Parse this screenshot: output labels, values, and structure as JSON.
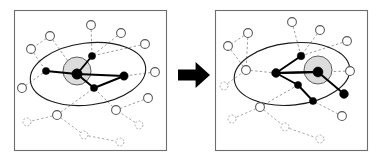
{
  "figure": {
    "panel_count": 2,
    "transition_symbol": "➡",
    "colors": {
      "background": "#ffffff",
      "panel_border": "#6e6e6e",
      "panel_fill": "#ffffff",
      "outer_ellipse_stroke": "#1a1a1a",
      "inner_circle_stroke": "#4d4d4d",
      "inner_circle_fill": "#dcdcdc",
      "core_node_fill": "#000000",
      "peripheral_node_fill": "#ffffff",
      "peripheral_node_stroke": "#555555",
      "faint_node_stroke": "#9a9a9a",
      "core_edge": "#000000",
      "peripheral_edge": "#8a8a8a",
      "dashed_edge": "#6f6f6f",
      "arrow_fill": "#000000"
    },
    "panels": [
      {
        "id": "before",
        "label": "left-panel",
        "frame": {
          "x": 14,
          "y": 10,
          "w": 152,
          "h": 140
        },
        "outer_ellipse": {
          "cx": 88,
          "cy": 74,
          "rx": 58,
          "ry": 31,
          "rotation": -7
        },
        "inner_circle": {
          "cx": 77,
          "cy": 71,
          "r": 14
        },
        "core_nodes": [
          {
            "name": "hub",
            "x": 77,
            "y": 74,
            "r": 5.2
          },
          {
            "name": "core-upper",
            "x": 92,
            "y": 56,
            "r": 3.6
          },
          {
            "name": "core-left",
            "x": 46,
            "y": 71,
            "r": 3.6
          },
          {
            "name": "core-right",
            "x": 124,
            "y": 76,
            "r": 4.2
          },
          {
            "name": "core-lower",
            "x": 94,
            "y": 88,
            "r": 3.6
          }
        ],
        "core_edges": [
          [
            "hub",
            "core-upper"
          ],
          [
            "hub",
            "core-left"
          ],
          [
            "hub",
            "core-right"
          ],
          [
            "hub",
            "core-lower"
          ],
          [
            "core-lower",
            "core-right"
          ]
        ],
        "peripheral_nodes": [
          {
            "name": "p1",
            "x": 91,
            "y": 25,
            "r": 4.4,
            "faint": false
          },
          {
            "name": "p2",
            "x": 121,
            "y": 33,
            "r": 4.4,
            "faint": false
          },
          {
            "name": "p3",
            "x": 145,
            "y": 44,
            "r": 4.4,
            "faint": false
          },
          {
            "name": "p4",
            "x": 50,
            "y": 36,
            "r": 4.4,
            "faint": false
          },
          {
            "name": "p5",
            "x": 31,
            "y": 49,
            "r": 4.4,
            "faint": false
          },
          {
            "name": "p6",
            "x": 155,
            "y": 72,
            "r": 4.4,
            "faint": false
          },
          {
            "name": "p7",
            "x": 22,
            "y": 88,
            "r": 4.4,
            "faint": false
          },
          {
            "name": "p8",
            "x": 148,
            "y": 98,
            "r": 4.4,
            "faint": false
          },
          {
            "name": "p9",
            "x": 116,
            "y": 110,
            "r": 4.4,
            "faint": false
          },
          {
            "name": "p10",
            "x": 57,
            "y": 115,
            "r": 4.4,
            "faint": false
          },
          {
            "name": "p11",
            "x": 27,
            "y": 122,
            "r": 4.0,
            "faint": true
          },
          {
            "name": "p12",
            "x": 139,
            "y": 125,
            "r": 4.0,
            "faint": true
          },
          {
            "name": "p13",
            "x": 84,
            "y": 135,
            "r": 4.0,
            "faint": true
          },
          {
            "name": "p14",
            "x": 120,
            "y": 142,
            "r": 4.0,
            "faint": true
          }
        ],
        "dashed_edges": [
          [
            "p1",
            "core-upper"
          ],
          [
            "p2",
            "core-upper"
          ],
          [
            "p3",
            "core-upper"
          ],
          [
            "p4",
            "p5"
          ],
          [
            "p4",
            "hub"
          ],
          [
            "p5",
            "core-left"
          ],
          [
            "p6",
            "core-right"
          ],
          [
            "p8",
            "p9"
          ],
          [
            "p9",
            "core-lower"
          ],
          [
            "p10",
            "core-lower"
          ],
          [
            "p10",
            "p11"
          ],
          [
            "p10",
            "p13"
          ],
          [
            "p13",
            "p14"
          ],
          [
            "p7",
            "core-left"
          ],
          [
            "p12",
            "p9"
          ]
        ]
      },
      {
        "id": "after",
        "label": "right-panel",
        "frame": {
          "x": 215,
          "y": 10,
          "w": 152,
          "h": 140
        },
        "outer_ellipse": {
          "cx": 292,
          "cy": 74,
          "rx": 58,
          "ry": 31,
          "rotation": -6
        },
        "inner_circle": {
          "cx": 318,
          "cy": 70,
          "r": 14
        },
        "core_nodes": [
          {
            "name": "hub",
            "x": 318,
            "y": 72,
            "r": 5.0
          },
          {
            "name": "core-upper",
            "x": 301,
            "y": 56,
            "r": 3.8
          },
          {
            "name": "core-left",
            "x": 276,
            "y": 73,
            "r": 4.4
          },
          {
            "name": "core-lower-left",
            "x": 298,
            "y": 85,
            "r": 3.6
          },
          {
            "name": "core-lower",
            "x": 313,
            "y": 101,
            "r": 3.6
          },
          {
            "name": "core-right",
            "x": 344,
            "y": 94,
            "r": 4.4
          }
        ],
        "core_edges": [
          [
            "hub",
            "core-left"
          ],
          [
            "hub",
            "core-right"
          ],
          [
            "core-left",
            "core-upper"
          ],
          [
            "core-left",
            "core-lower-left"
          ],
          [
            "core-lower-left",
            "core-lower"
          ],
          [
            "core-left",
            "hub"
          ]
        ],
        "peripheral_nodes": [
          {
            "name": "q1",
            "x": 292,
            "y": 22,
            "r": 4.4,
            "faint": false
          },
          {
            "name": "q2",
            "x": 320,
            "y": 30,
            "r": 4.4,
            "faint": false
          },
          {
            "name": "q3",
            "x": 347,
            "y": 41,
            "r": 4.4,
            "faint": false
          },
          {
            "name": "q4",
            "x": 248,
            "y": 33,
            "r": 4.4,
            "faint": false
          },
          {
            "name": "q5",
            "x": 228,
            "y": 46,
            "r": 4.4,
            "faint": false
          },
          {
            "name": "q6",
            "x": 246,
            "y": 70,
            "r": 4.4,
            "faint": false
          },
          {
            "name": "q7",
            "x": 350,
            "y": 71,
            "r": 4.4,
            "faint": false
          },
          {
            "name": "q8",
            "x": 224,
            "y": 86,
            "r": 4.0,
            "faint": true
          },
          {
            "name": "q9",
            "x": 260,
            "y": 107,
            "r": 4.4,
            "faint": false
          },
          {
            "name": "q10",
            "x": 342,
            "y": 116,
            "r": 4.4,
            "faint": false
          },
          {
            "name": "q11",
            "x": 232,
            "y": 119,
            "r": 4.0,
            "faint": true
          },
          {
            "name": "q12",
            "x": 285,
            "y": 127,
            "r": 4.0,
            "faint": true
          },
          {
            "name": "q13",
            "x": 320,
            "y": 139,
            "r": 4.0,
            "faint": true
          }
        ],
        "dashed_edges": [
          [
            "q1",
            "core-upper"
          ],
          [
            "q2",
            "core-upper"
          ],
          [
            "q3",
            "core-upper"
          ],
          [
            "q4",
            "q5"
          ],
          [
            "q4",
            "q6"
          ],
          [
            "q5",
            "q6"
          ],
          [
            "q6",
            "core-left"
          ],
          [
            "q7",
            "hub"
          ],
          [
            "q8",
            "q6"
          ],
          [
            "q9",
            "core-lower-left"
          ],
          [
            "q9",
            "q11"
          ],
          [
            "q9",
            "q12"
          ],
          [
            "q10",
            "core-lower"
          ],
          [
            "q12",
            "q13"
          ]
        ]
      }
    ],
    "arrow": {
      "name": "transition-arrow",
      "x": 178,
      "y": 62,
      "w": 32,
      "h": 26
    }
  }
}
